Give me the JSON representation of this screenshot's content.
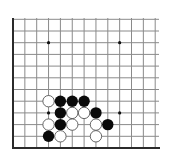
{
  "board": {
    "view": "bottom-left corner of 19x19 board (partial diagram)",
    "columns_visible": 13,
    "rows_visible": 12,
    "geometry": {
      "origin_x": 13,
      "origin_y": 148,
      "spacing_x": 11.85,
      "spacing_y": 11.7,
      "top_y": 18,
      "right_x": 159,
      "stone_radius": 5.7
    },
    "edges": [
      "left",
      "bottom"
    ],
    "colors": {
      "background": "#ffffff",
      "grid": "#8a8a8a",
      "edge": "#2a2a2a",
      "black_stone": "#0a0a0a",
      "white_stone": "#ffffff",
      "white_outline": "#555555"
    },
    "star_points": [
      {
        "col": 3,
        "row": 9
      },
      {
        "col": 9,
        "row": 9
      },
      {
        "col": 3,
        "row": 3
      },
      {
        "col": 9,
        "row": 3
      }
    ],
    "stones": [
      {
        "color": "white",
        "col": 3,
        "row": 4
      },
      {
        "color": "black",
        "col": 4,
        "row": 4
      },
      {
        "color": "black",
        "col": 5,
        "row": 4
      },
      {
        "color": "black",
        "col": 6,
        "row": 4
      },
      {
        "color": "black",
        "col": 4,
        "row": 3
      },
      {
        "color": "white",
        "col": 5,
        "row": 3
      },
      {
        "color": "white",
        "col": 6,
        "row": 3
      },
      {
        "color": "black",
        "col": 7,
        "row": 3
      },
      {
        "color": "white",
        "col": 3,
        "row": 2
      },
      {
        "color": "black",
        "col": 4,
        "row": 2
      },
      {
        "color": "white",
        "col": 5,
        "row": 2
      },
      {
        "color": "white",
        "col": 7,
        "row": 2
      },
      {
        "color": "black",
        "col": 8,
        "row": 2
      },
      {
        "color": "black",
        "col": 3,
        "row": 1
      },
      {
        "color": "white",
        "col": 4,
        "row": 1
      },
      {
        "color": "white",
        "col": 7,
        "row": 1
      }
    ]
  }
}
